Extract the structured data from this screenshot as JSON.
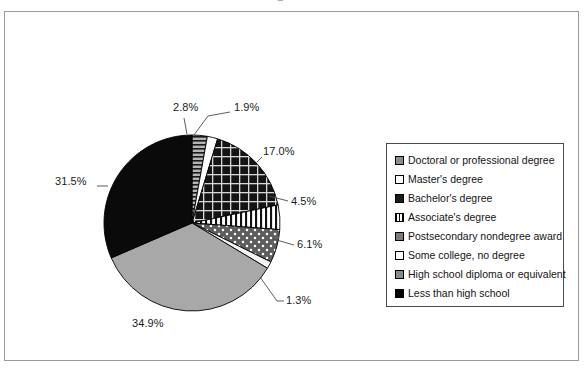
{
  "frame": {
    "border_color": "#9a9a9a",
    "background": "#ffffff"
  },
  "top_artifact": {
    "glyph_a": "■",
    "glyph_b": "▪"
  },
  "legend": {
    "title": "",
    "items": [
      {
        "label": "Doctoral or professional degree",
        "swatch": "gray-dotted-square",
        "class": "sw-dots-gray"
      },
      {
        "label": "Master's degree",
        "swatch": "white-square",
        "class": "sw-white"
      },
      {
        "label": "Bachelor's degree",
        "swatch": "dark-grid-square",
        "class": "sw-grid-dark"
      },
      {
        "label": "Associate's degree",
        "swatch": "vertical-lines-square",
        "class": "sw-vlines"
      },
      {
        "label": "Postsecondary nondegree award",
        "swatch": "gray-square",
        "class": "sw-gray-solid"
      },
      {
        "label": "Some college, no degree",
        "swatch": "white-dot-square",
        "class": "sw-white-dot"
      },
      {
        "label": "High school diploma or equivalent",
        "swatch": "gray-mid-square",
        "class": "sw-gray-mid"
      },
      {
        "label": "Less than high school",
        "swatch": "black-square",
        "class": "sw-black"
      }
    ]
  },
  "chart_data": {
    "type": "pie",
    "title": "",
    "subtitle": "",
    "xlabel": "",
    "ylabel": "",
    "legend_position": "right",
    "grid": false,
    "start_angle_deg": 0,
    "direction": "clockwise",
    "categories": [
      "Postsecondary nondegree award",
      "Master's degree",
      "Bachelor's degree",
      "Associate's degree",
      "Some college, no degree",
      "Doctoral or professional degree",
      "High school diploma or equivalent",
      "Less than high school"
    ],
    "values": [
      2.8,
      1.9,
      17.0,
      4.5,
      6.1,
      1.3,
      34.9,
      31.5
    ],
    "data_labels": [
      "2.8%",
      "1.9%",
      "17.0%",
      "4.5%",
      "6.1%",
      "1.3%",
      "34.9%",
      "31.5%"
    ],
    "units": "percent",
    "total": 100.0
  },
  "pie": {
    "center_x": 187,
    "center_y": 211,
    "radius": 88,
    "slices": [
      {
        "name": "postsecondary-nondegree-award",
        "value": 2.8,
        "label": "2.8%",
        "fill": "url(#pat-hlines-gray)"
      },
      {
        "name": "masters-degree",
        "value": 1.9,
        "label": "1.9%",
        "fill": "#ffffff"
      },
      {
        "name": "bachelors-degree",
        "value": 17.0,
        "label": "17.0%",
        "fill": "url(#pat-grid-dark)"
      },
      {
        "name": "associates-degree",
        "value": 4.5,
        "label": "4.5%",
        "fill": "url(#pat-vlines)"
      },
      {
        "name": "some-college-no-degree",
        "value": 6.1,
        "label": "6.1%",
        "fill": "url(#pat-dots-dark)"
      },
      {
        "name": "doctoral-or-professional-degree",
        "value": 1.3,
        "label": "1.3%",
        "fill": "#f2f2f2"
      },
      {
        "name": "high-school-diploma-or-equivalent",
        "value": 34.9,
        "label": "34.9%",
        "fill": "#a8a8a8"
      },
      {
        "name": "less-than-high-school",
        "value": 31.5,
        "label": "31.5%",
        "fill": "#0a0a0a"
      }
    ]
  },
  "labels": [
    {
      "name": "pct-label-2-8",
      "text": "2.8%",
      "x": 168,
      "y": 96
    },
    {
      "name": "pct-label-1-9",
      "text": "1.9%",
      "x": 229,
      "y": 96
    },
    {
      "name": "pct-label-17-0",
      "text": "17.0%",
      "x": 258,
      "y": 140
    },
    {
      "name": "pct-label-4-5",
      "text": "4.5%",
      "x": 286,
      "y": 190
    },
    {
      "name": "pct-label-6-1",
      "text": "6.1%",
      "x": 292,
      "y": 232
    },
    {
      "name": "pct-label-1-3",
      "text": "1.3%",
      "x": 281,
      "y": 288
    },
    {
      "name": "pct-label-34-9",
      "text": "34.9%",
      "x": 127,
      "y": 312
    },
    {
      "name": "pct-label-31-5",
      "text": "31.5%",
      "x": 57,
      "y": 170
    }
  ]
}
